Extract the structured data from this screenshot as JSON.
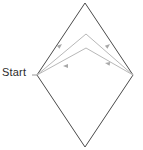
{
  "figure": {
    "title": "",
    "background_color": "#ffffff",
    "labels": [
      {
        "name": "start-label",
        "text": "Start",
        "x": 2,
        "y": 66,
        "color": "#2b2b2b",
        "font_size": 11
      }
    ],
    "shapes": {
      "diamond": {
        "name": "diamond-outline",
        "stroke": "#4a4a4a",
        "stroke_width": 1,
        "fill": "none",
        "vertices": [
          {
            "label": "top",
            "x": 85,
            "y": 3
          },
          {
            "label": "right",
            "x": 133,
            "y": 75
          },
          {
            "label": "bottom",
            "x": 85,
            "y": 147
          },
          {
            "label": "left",
            "x": 37,
            "y": 75
          }
        ]
      },
      "paths": [
        {
          "name": "inner-chevron-upper",
          "stroke": "#b8b8b8",
          "stroke_width": 1,
          "fill": "none",
          "points": [
            {
              "x": 37,
              "y": 75
            },
            {
              "x": 86,
              "y": 34
            },
            {
              "x": 133,
              "y": 75
            }
          ],
          "arrow_direction": "toward-apex"
        },
        {
          "name": "inner-chevron-lower",
          "stroke": "#b8b8b8",
          "stroke_width": 1,
          "fill": "none",
          "points": [
            {
              "x": 37,
              "y": 75
            },
            {
              "x": 86,
              "y": 48
            },
            {
              "x": 133,
              "y": 75
            }
          ],
          "arrow_direction": "toward-start"
        }
      ],
      "arrowheads": [
        {
          "name": "arrowhead-upper-left",
          "x": 62,
          "y": 44,
          "angle": -40,
          "color": "#a8a8a8"
        },
        {
          "name": "arrowhead-upper-right",
          "x": 110,
          "y": 44,
          "angle": -40,
          "color": "#a8a8a8"
        },
        {
          "name": "arrowhead-lower-left",
          "x": 63,
          "y": 66,
          "angle": 180,
          "color": "#a8a8a8"
        },
        {
          "name": "arrowhead-lower-right",
          "x": 105,
          "y": 63,
          "angle": 190,
          "color": "#a8a8a8"
        }
      ]
    }
  }
}
